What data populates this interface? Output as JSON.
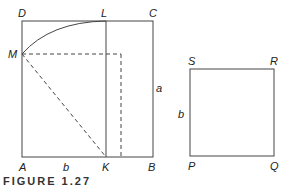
{
  "figure": {
    "caption": "FIGURE 1.27",
    "left_diagram": {
      "labels": {
        "D": "D",
        "L": "L",
        "C": "C",
        "M": "M",
        "a": "a",
        "A": "A",
        "b": "b",
        "K": "K",
        "B": "B"
      }
    },
    "right_diagram": {
      "labels": {
        "S": "S",
        "R": "R",
        "b": "b",
        "P": "P",
        "Q": "Q"
      }
    },
    "colors": {
      "line": "#444444",
      "text": "#222222"
    }
  }
}
